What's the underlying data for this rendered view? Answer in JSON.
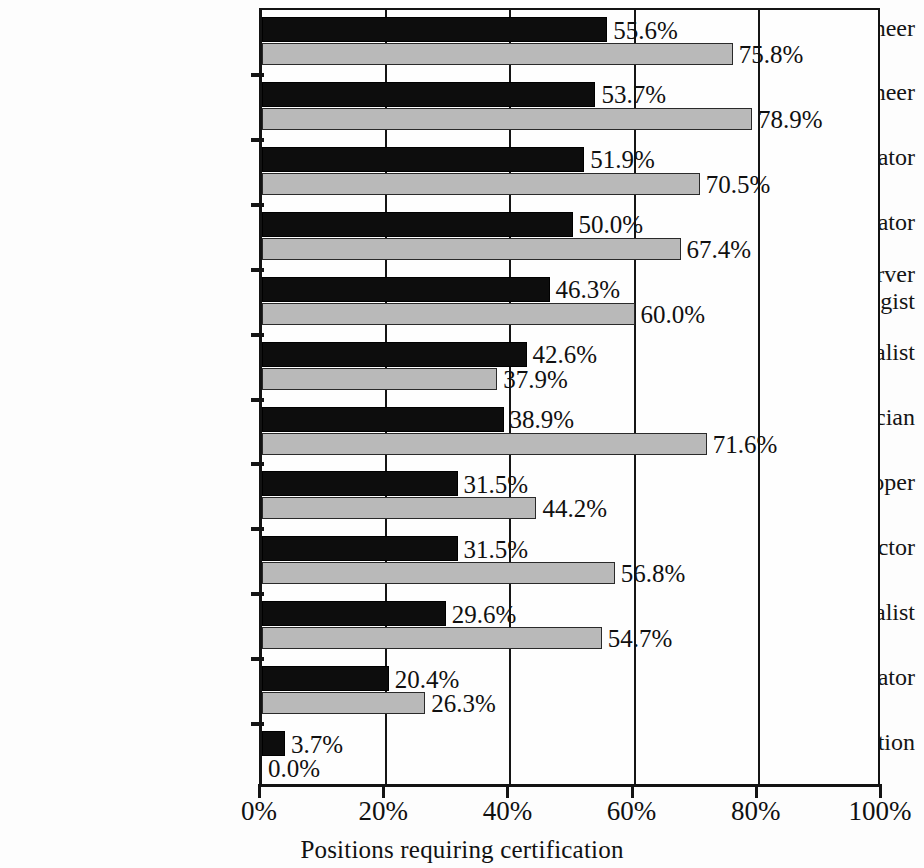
{
  "chart_data": {
    "type": "bar",
    "orientation": "horizontal",
    "title": "",
    "xlabel": "Positions requiring certification",
    "ylabel": "",
    "xlim": [
      0,
      100
    ],
    "xticks": [
      "0%",
      "20%",
      "40%",
      "60%",
      "80%",
      "100%"
    ],
    "xtick_values": [
      0,
      20,
      40,
      60,
      80,
      100
    ],
    "grid": "vertical",
    "legend": "none",
    "categories": [
      "System engineer",
      "Network engineer",
      "Network administrator",
      "System administrator",
      "Client/server technologist",
      "Database specialist",
      "Service technician",
      "Application developer",
      "Instructor",
      "Application specialist",
      "System operator",
      "Other position"
    ],
    "series": [
      {
        "name": "series-1",
        "color": "#0d0d0d",
        "values": [
          55.6,
          53.7,
          51.9,
          50.0,
          46.3,
          42.6,
          38.9,
          31.5,
          31.5,
          29.6,
          20.4,
          3.7
        ],
        "labels": [
          "55.6%",
          "53.7%",
          "51.9%",
          "50.0%",
          "46.3%",
          "42.6%",
          "38.9%",
          "31.5%",
          "31.5%",
          "29.6%",
          "20.4%",
          "3.7%"
        ]
      },
      {
        "name": "series-2",
        "color": "#b9b9b9",
        "values": [
          75.8,
          78.9,
          70.5,
          67.4,
          60.0,
          37.9,
          71.6,
          44.2,
          56.8,
          54.7,
          26.3,
          0.0
        ],
        "labels": [
          "75.8%",
          "78.9%",
          "70.5%",
          "67.4%",
          "60.0%",
          "37.9%",
          "71.6%",
          "44.2%",
          "56.8%",
          "54.7%",
          "26.3%",
          "0.0%"
        ]
      }
    ]
  },
  "axis": {
    "x_title": "Positions requiring certification",
    "tick_0": "0%",
    "tick_1": "20%",
    "tick_2": "40%",
    "tick_3": "60%",
    "tick_4": "80%",
    "tick_5": "100%"
  },
  "category_labels": [
    {
      "line1": "System engineer",
      "line2": ""
    },
    {
      "line1": "Network engineer",
      "line2": ""
    },
    {
      "line1": "Network administrator",
      "line2": ""
    },
    {
      "line1": "System administrator",
      "line2": ""
    },
    {
      "line1": "Client/server",
      "line2": "technologist"
    },
    {
      "line1": "Database specialist",
      "line2": ""
    },
    {
      "line1": "Service technician",
      "line2": ""
    },
    {
      "line1": "Application developer",
      "line2": ""
    },
    {
      "line1": "Instructor",
      "line2": ""
    },
    {
      "line1": "Application specialist",
      "line2": ""
    },
    {
      "line1": "System operator",
      "line2": ""
    },
    {
      "line1": "Other position",
      "line2": ""
    }
  ]
}
